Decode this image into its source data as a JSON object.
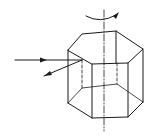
{
  "diagram": {
    "title": "",
    "colors": {
      "background": "#ffffff",
      "stroke": "#1a1a1a"
    },
    "labels": []
  }
}
